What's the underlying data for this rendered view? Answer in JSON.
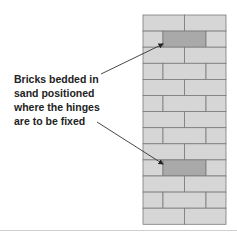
{
  "diagram": {
    "label_lines": [
      "Bricks bedded in",
      "sand positioned",
      "where the hinges",
      "are to be fixed"
    ],
    "wall": {
      "rows": 13,
      "highlighted_rows": [
        1,
        9
      ],
      "brick_fill": "#d6d6d6",
      "highlight_fill": "#a9a9a9",
      "mortar_color": "#7a7a7a"
    },
    "arrows": [
      {
        "from": [
          101,
          74
        ],
        "to": [
          163,
          44
        ]
      },
      {
        "from": [
          97,
          122
        ],
        "to": [
          163,
          164
        ]
      }
    ]
  }
}
